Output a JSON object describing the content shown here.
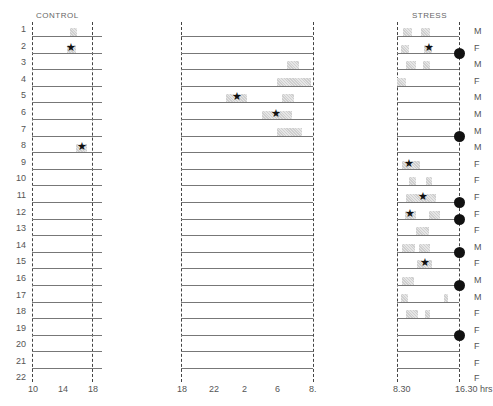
{
  "figure": {
    "panels": [
      {
        "id": "control",
        "title": "CONTROL",
        "x_ticks": [
          "10",
          "14",
          "18"
        ]
      },
      {
        "id": "night",
        "title": "",
        "x_ticks": [
          "18",
          "22",
          "2",
          "6",
          "8."
        ]
      },
      {
        "id": "stress",
        "title": "STRESS",
        "x_ticks": [
          "8.30",
          "16.30 hrs"
        ]
      }
    ],
    "row_labels": [
      "1",
      "2",
      "3",
      "4",
      "5",
      "6",
      "7",
      "8",
      "9",
      "10",
      "11",
      "12",
      "13",
      "14",
      "15",
      "16",
      "17",
      "18",
      "19",
      "20",
      "21",
      "22"
    ],
    "stress_sex": [
      "M",
      "F",
      "M",
      "F",
      "M",
      "M",
      "M",
      "M",
      "F",
      "F",
      "F",
      "F",
      "F",
      "M",
      "F",
      "M",
      "M",
      "F",
      "F",
      "F",
      "F",
      "F"
    ]
  },
  "chart_data": {
    "type": "timeline",
    "title": "",
    "panels": [
      {
        "name": "CONTROL",
        "x_range": [
          10,
          18
        ],
        "x_ticks": [
          10,
          14,
          18
        ],
        "events": [
          {
            "row": 1,
            "start": 15.0,
            "end": 16.0,
            "star": false
          },
          {
            "row": 2,
            "start": 14.6,
            "end": 15.8,
            "star": true,
            "star_at": 15.2
          },
          {
            "row": 8,
            "start": 15.8,
            "end": 17.3,
            "star": true,
            "star_at": 16.6
          }
        ]
      },
      {
        "name": "NIGHT",
        "x_range": [
          18,
          32
        ],
        "x_ticks": [
          "18",
          "22",
          "2",
          "6",
          "8"
        ],
        "events": [
          {
            "row": 3,
            "start": 29.2,
            "end": 30.5,
            "star": false
          },
          {
            "row": 4,
            "start": 28.2,
            "end": 31.8,
            "star": false
          },
          {
            "row": 5,
            "start": 22.8,
            "end": 25.0,
            "star": true,
            "star_at": 23.9
          },
          {
            "row": 5,
            "start": 28.7,
            "end": 30.0,
            "star": false
          },
          {
            "row": 6,
            "start": 26.6,
            "end": 29.8,
            "star": true,
            "star_at": 28.1
          },
          {
            "row": 7,
            "start": 28.2,
            "end": 30.8,
            "star": false
          }
        ]
      },
      {
        "name": "STRESS",
        "x_range": [
          8.5,
          16.5
        ],
        "x_ticks": [
          "8.30",
          "16.30"
        ],
        "x_unit": "hrs",
        "events": [
          {
            "row": 1,
            "start": 9.3,
            "end": 10.4,
            "star": false
          },
          {
            "row": 1,
            "start": 11.6,
            "end": 12.8,
            "star": false
          },
          {
            "row": 2,
            "start": 9.0,
            "end": 10.0,
            "star": false
          },
          {
            "row": 2,
            "start": 12.0,
            "end": 13.0,
            "star": true,
            "star_at": 12.6
          },
          {
            "row": 3,
            "start": 9.6,
            "end": 11.0,
            "star": false
          },
          {
            "row": 3,
            "start": 11.9,
            "end": 12.8,
            "star": false
          },
          {
            "row": 4,
            "start": 8.5,
            "end": 9.7,
            "star": false
          },
          {
            "row": 9,
            "start": 9.2,
            "end": 11.5,
            "star": true,
            "star_at": 10.1
          },
          {
            "row": 10,
            "start": 10.1,
            "end": 11.0,
            "star": false
          },
          {
            "row": 10,
            "start": 12.2,
            "end": 13.0,
            "star": false
          },
          {
            "row": 11,
            "start": 9.6,
            "end": 13.5,
            "star": true,
            "star_at": 11.8
          },
          {
            "row": 12,
            "start": 9.5,
            "end": 11.0,
            "star": true,
            "star_at": 10.2
          },
          {
            "row": 12,
            "start": 12.6,
            "end": 14.0,
            "star": false
          },
          {
            "row": 13,
            "start": 11.0,
            "end": 12.6,
            "star": false
          },
          {
            "row": 14,
            "start": 9.2,
            "end": 10.8,
            "star": false
          },
          {
            "row": 14,
            "start": 11.3,
            "end": 12.8,
            "star": false
          },
          {
            "row": 15,
            "start": 11.1,
            "end": 13.0,
            "star": true,
            "star_at": 12.1
          },
          {
            "row": 16,
            "start": 9.1,
            "end": 10.7,
            "star": false
          },
          {
            "row": 17,
            "start": 9.0,
            "end": 9.9,
            "star": false
          },
          {
            "row": 17,
            "start": 14.6,
            "end": 15.1,
            "star": false
          },
          {
            "row": 18,
            "start": 9.6,
            "end": 11.2,
            "star": false
          },
          {
            "row": 18,
            "start": 12.1,
            "end": 12.8,
            "star": false
          }
        ],
        "dots_rows": [
          2,
          7,
          11,
          12,
          14,
          16,
          19
        ]
      }
    ],
    "ylabel": "Subject",
    "grid": true,
    "legend": null
  }
}
